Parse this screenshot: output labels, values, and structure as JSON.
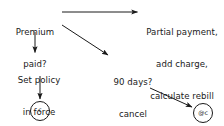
{
  "diagram": {
    "background_color": "#ffffff",
    "stroke_color": "#1a1a1a",
    "nodes": [
      {
        "id": "premium-paid",
        "name": "premium-paid-question",
        "lines": [
          "Premium",
          "paid?"
        ],
        "text": "Premium paid?"
      },
      {
        "id": "partial-payment",
        "name": "partial-payment-action",
        "lines": [
          "Partial payment,",
          "add charge,",
          "calculate rebill"
        ],
        "text": "Partial payment, add charge, calculate rebill"
      },
      {
        "id": "set-policy",
        "name": "set-policy-in-force-action",
        "lines": [
          "Set policy",
          "in force"
        ],
        "text": "Set policy in force"
      },
      {
        "id": "ninety-days",
        "name": "ninety-days-cancel-action",
        "lines": [
          "90 days?",
          "cancel",
          "policy"
        ],
        "text": "90 days? cancel policy"
      }
    ],
    "terminators": [
      {
        "id": "terminal-c",
        "name": "terminator-circle-c",
        "label": "c"
      },
      {
        "id": "terminal-at-c",
        "name": "terminator-circle-at-c",
        "label": "@c"
      }
    ],
    "edges": [
      {
        "id": "edge-premium-to-partial",
        "name": "arrow-premium-to-partial",
        "label": ""
      },
      {
        "id": "edge-premium-to-setpolicy",
        "name": "arrow-premium-to-set-policy",
        "label": ""
      },
      {
        "id": "edge-premium-to-ninetydays",
        "name": "arrow-premium-to-ninety-days",
        "label": ""
      },
      {
        "id": "edge-setpolicy-to-terminal",
        "name": "arrow-set-policy-to-terminator-c",
        "label": ""
      },
      {
        "id": "edge-ninetydays-to-terminal",
        "name": "arrow-ninety-days-to-terminator-at-c",
        "label": ""
      }
    ]
  }
}
